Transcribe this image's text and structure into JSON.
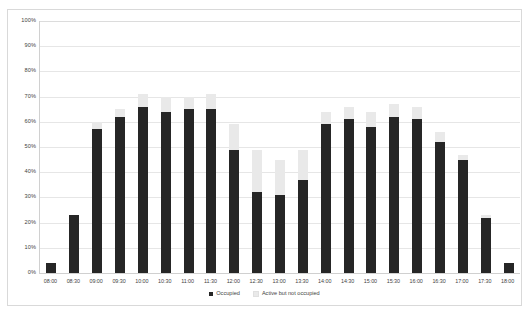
{
  "chart_data": {
    "type": "bar",
    "stacked": true,
    "title": "",
    "subtitle": "",
    "xlabel": "",
    "ylabel": "",
    "ylim": [
      0,
      100
    ],
    "y_unit": "%",
    "grid": true,
    "legend_position": "bottom",
    "categories": [
      "08:00",
      "08:30",
      "09:00",
      "09:30",
      "10:00",
      "10:30",
      "11:00",
      "11:30",
      "12:00",
      "12:30",
      "13:00",
      "13:30",
      "14:00",
      "14:30",
      "15:00",
      "15:30",
      "16:00",
      "16:30",
      "17:00",
      "17:30",
      "18:00"
    ],
    "y_ticks": [
      "0%",
      "10%",
      "20%",
      "30%",
      "40%",
      "50%",
      "60%",
      "70%",
      "80%",
      "90%",
      "100%"
    ],
    "y_tick_values": [
      0,
      10,
      20,
      30,
      40,
      50,
      60,
      70,
      80,
      90,
      100
    ],
    "series": [
      {
        "name": "Occupied",
        "color": "#262626",
        "values": [
          4,
          23,
          57,
          62,
          66,
          64,
          65,
          65,
          49,
          32,
          31,
          37,
          59,
          61,
          58,
          62,
          61,
          52,
          45,
          22,
          4
        ]
      },
      {
        "name": "Active but not occupied",
        "color": "#e9e9e9",
        "values": [
          0,
          0,
          3,
          3,
          5,
          6,
          5,
          6,
          10,
          17,
          14,
          12,
          5,
          5,
          6,
          5,
          5,
          4,
          2,
          1,
          0
        ]
      }
    ],
    "totals": [
      4,
      23,
      60,
      65,
      71,
      70,
      70,
      71,
      59,
      49,
      45,
      49,
      64,
      66,
      64,
      67,
      66,
      56,
      47,
      23,
      4
    ]
  },
  "legend": {
    "items": [
      {
        "label": "Occupied",
        "color": "#262626"
      },
      {
        "label": "Active but not occupied",
        "color": "#e9e9e9"
      }
    ]
  }
}
